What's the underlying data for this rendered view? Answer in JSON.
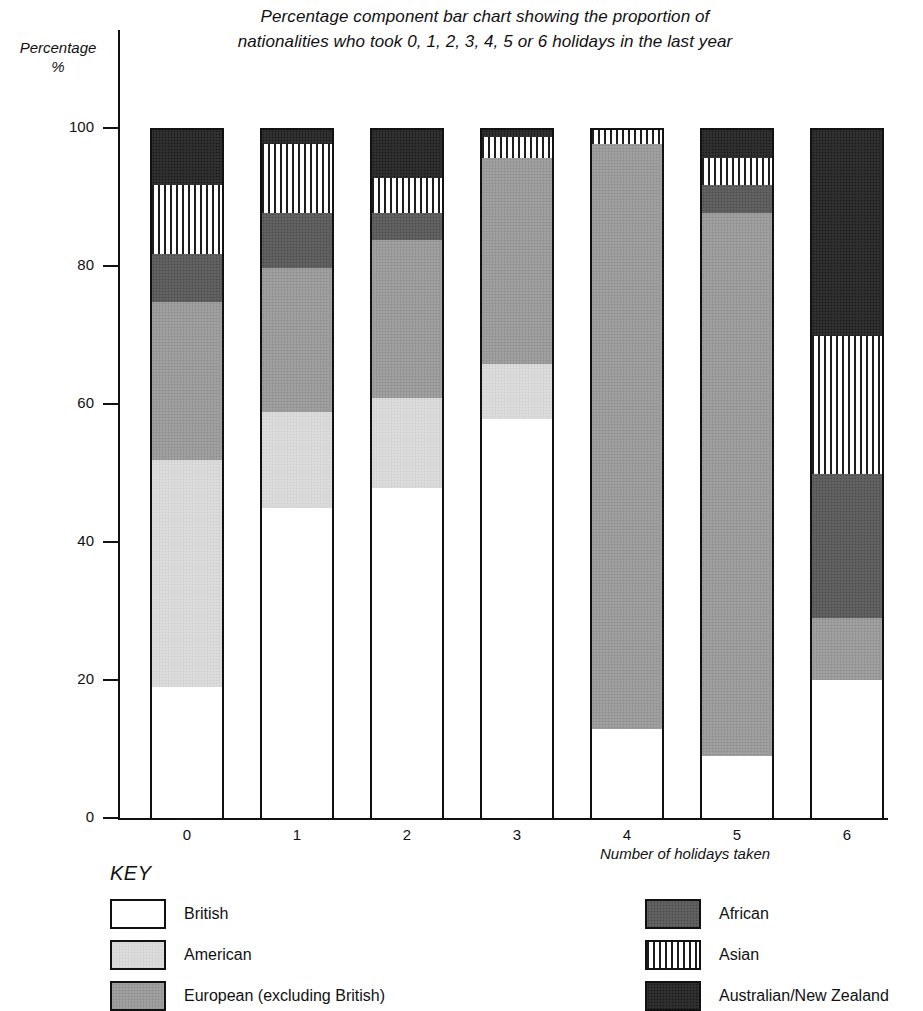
{
  "chart_data": {
    "type": "bar",
    "subtype": "percentage-component-stacked",
    "title": "Percentage component bar chart showing the proportion of nationalities who took 0, 1, 2, 3, 4, 5 or 6 holidays in the last year",
    "title_lines": [
      "Percentage component bar chart showing the proportion of",
      "nationalities who took 0, 1, 2, 3, 4, 5 or 6 holidays in the last year"
    ],
    "xlabel": "Number of holidays taken",
    "ylabel": "Percentage\n%",
    "ylabel_lines": [
      "Percentage",
      "%"
    ],
    "categories": [
      "0",
      "1",
      "2",
      "3",
      "4",
      "5",
      "6"
    ],
    "ylim": [
      0,
      100
    ],
    "yticks": [
      0,
      20,
      40,
      60,
      80,
      100
    ],
    "ytick_labels": [
      "0",
      "20",
      "40",
      "60",
      "80",
      "100"
    ],
    "grid": false,
    "legend_position": "below-axis",
    "series": [
      {
        "name": "British",
        "pattern": "white",
        "values": [
          19,
          45,
          48,
          58,
          13,
          9,
          20
        ]
      },
      {
        "name": "American",
        "pattern": "light-grey-stipple",
        "values": [
          33,
          14,
          13,
          8,
          0,
          0,
          0
        ]
      },
      {
        "name": "European (excluding British)",
        "pattern": "mid-grey-stipple",
        "values": [
          23,
          21,
          23,
          30,
          85,
          79,
          9
        ]
      },
      {
        "name": "African",
        "pattern": "dark-grey-stipple",
        "values": [
          7,
          8,
          4,
          0,
          0,
          4,
          21
        ]
      },
      {
        "name": "Asian",
        "pattern": "vertical-stripes",
        "values": [
          10,
          10,
          5,
          3,
          2,
          4,
          20
        ]
      },
      {
        "name": "Australian/New Zealand",
        "pattern": "black-stipple",
        "values": [
          8,
          2,
          7,
          1,
          0,
          4,
          30
        ]
      }
    ]
  },
  "key": {
    "title": "KEY",
    "items": [
      {
        "label": "British",
        "pattern": "british"
      },
      {
        "label": "American",
        "pattern": "american"
      },
      {
        "label": "European (excluding British)",
        "pattern": "european"
      },
      {
        "label": "African",
        "pattern": "african"
      },
      {
        "label": "Asian",
        "pattern": "asian"
      },
      {
        "label": "Australian/New Zealand",
        "pattern": "ausnz"
      }
    ]
  }
}
